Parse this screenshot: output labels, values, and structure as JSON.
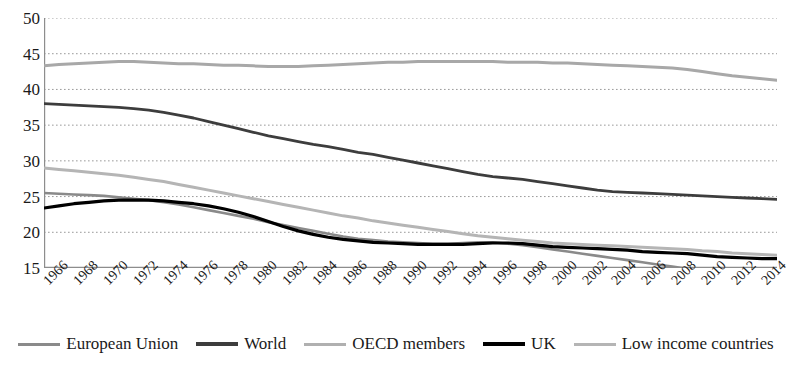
{
  "chart_data": {
    "type": "line",
    "title": "",
    "xlabel": "",
    "ylabel": "",
    "ylim": [
      15,
      50
    ],
    "ytick_values": [
      15,
      20,
      25,
      30,
      35,
      40,
      45,
      50
    ],
    "ytick_labels": [
      "15",
      "20",
      "25",
      "30",
      "35",
      "40",
      "45",
      "50"
    ],
    "grid": true,
    "grid_style": "dotted-horizontal",
    "legend_position": "bottom",
    "xlim": [
      1966,
      2015
    ],
    "x": [
      1966,
      1967,
      1968,
      1969,
      1970,
      1971,
      1972,
      1973,
      1974,
      1975,
      1976,
      1977,
      1978,
      1979,
      1980,
      1981,
      1982,
      1983,
      1984,
      1985,
      1986,
      1987,
      1988,
      1989,
      1990,
      1991,
      1992,
      1993,
      1994,
      1995,
      1996,
      1997,
      1998,
      1999,
      2000,
      2001,
      2002,
      2003,
      2004,
      2005,
      2006,
      2007,
      2008,
      2009,
      2010,
      2011,
      2012,
      2013,
      2014,
      2015
    ],
    "xtick_labels": [
      "1966",
      "1968",
      "1970",
      "1972",
      "1974",
      "1976",
      "1978",
      "1980",
      "1982",
      "1984",
      "1986",
      "1988",
      "1990",
      "1992",
      "1994",
      "1996",
      "1998",
      "2000",
      "2002",
      "2004",
      "2006",
      "2008",
      "2010",
      "2012",
      "2014"
    ],
    "series": [
      {
        "name": "European Union",
        "color": "#8a8a8a",
        "width": 2.6,
        "values": [
          25.5,
          25.4,
          25.3,
          25.2,
          25.1,
          24.9,
          24.7,
          24.5,
          24.2,
          23.9,
          23.5,
          23.1,
          22.7,
          22.3,
          21.9,
          21.4,
          21.0,
          20.6,
          20.2,
          19.8,
          19.4,
          19.1,
          18.9,
          18.7,
          18.6,
          18.5,
          18.4,
          18.4,
          18.5,
          18.6,
          18.6,
          18.4,
          18.2,
          17.9,
          17.6,
          17.3,
          17.0,
          16.7,
          16.4,
          16.1,
          15.8,
          15.5,
          15.2,
          14.9,
          14.8,
          14.7,
          14.6,
          14.5,
          14.4,
          14.4
        ]
      },
      {
        "name": "World",
        "color": "#3d3d3d",
        "width": 2.8,
        "values": [
          38.0,
          37.9,
          37.8,
          37.7,
          37.6,
          37.5,
          37.3,
          37.1,
          36.8,
          36.4,
          36.0,
          35.5,
          35.0,
          34.5,
          34.0,
          33.5,
          33.1,
          32.7,
          32.3,
          32.0,
          31.6,
          31.2,
          30.9,
          30.5,
          30.1,
          29.7,
          29.3,
          28.9,
          28.5,
          28.1,
          27.8,
          27.6,
          27.4,
          27.1,
          26.8,
          26.5,
          26.2,
          25.9,
          25.7,
          25.6,
          25.5,
          25.4,
          25.3,
          25.2,
          25.1,
          25.0,
          24.9,
          24.8,
          24.7,
          24.6
        ]
      },
      {
        "name": "OECD members",
        "color": "#a8a8a8",
        "width": 3.0,
        "values": [
          43.3,
          43.5,
          43.6,
          43.7,
          43.8,
          43.9,
          43.9,
          43.8,
          43.7,
          43.6,
          43.6,
          43.5,
          43.4,
          43.4,
          43.3,
          43.2,
          43.2,
          43.2,
          43.3,
          43.4,
          43.5,
          43.6,
          43.7,
          43.8,
          43.8,
          43.9,
          43.9,
          43.9,
          43.9,
          43.9,
          43.9,
          43.8,
          43.8,
          43.8,
          43.7,
          43.7,
          43.6,
          43.5,
          43.4,
          43.3,
          43.2,
          43.1,
          43.0,
          42.8,
          42.5,
          42.2,
          41.9,
          41.7,
          41.5,
          41.3
        ]
      },
      {
        "name": "UK",
        "color": "#000000",
        "width": 3.2,
        "values": [
          23.4,
          23.7,
          24.0,
          24.2,
          24.4,
          24.5,
          24.5,
          24.5,
          24.4,
          24.2,
          24.0,
          23.7,
          23.3,
          22.8,
          22.2,
          21.5,
          20.8,
          20.2,
          19.7,
          19.3,
          19.0,
          18.8,
          18.6,
          18.5,
          18.4,
          18.3,
          18.3,
          18.3,
          18.3,
          18.4,
          18.5,
          18.5,
          18.4,
          18.2,
          18.0,
          17.9,
          17.8,
          17.7,
          17.6,
          17.5,
          17.3,
          17.2,
          17.1,
          17.0,
          16.8,
          16.6,
          16.5,
          16.4,
          16.3,
          16.3
        ]
      },
      {
        "name": "Low income countries",
        "color": "#b5b5b5",
        "width": 3.0,
        "values": [
          29.0,
          28.8,
          28.6,
          28.4,
          28.2,
          28.0,
          27.7,
          27.4,
          27.1,
          26.7,
          26.3,
          25.9,
          25.5,
          25.1,
          24.7,
          24.3,
          23.9,
          23.5,
          23.1,
          22.7,
          22.3,
          22.0,
          21.6,
          21.3,
          21.0,
          20.7,
          20.4,
          20.1,
          19.8,
          19.5,
          19.3,
          19.1,
          18.9,
          18.7,
          18.5,
          18.4,
          18.3,
          18.2,
          18.1,
          18.0,
          17.9,
          17.8,
          17.7,
          17.6,
          17.4,
          17.3,
          17.1,
          17.0,
          16.9,
          16.8
        ]
      }
    ]
  },
  "legend": {
    "items": [
      {
        "label": "European Union",
        "color": "#8a8a8a",
        "thickness": "3px"
      },
      {
        "label": "World",
        "color": "#3d3d3d",
        "thickness": "4px"
      },
      {
        "label": "OECD members",
        "color": "#b0b0b0",
        "thickness": "3px"
      },
      {
        "label": "UK",
        "color": "#000000",
        "thickness": "4px"
      },
      {
        "label": "Low income countries",
        "color": "#b5b5b5",
        "thickness": "3px"
      }
    ]
  }
}
